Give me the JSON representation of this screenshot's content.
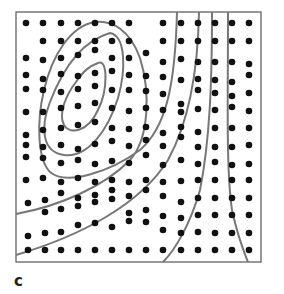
{
  "figure": {
    "panel_label": "c",
    "frame": {
      "x": 16,
      "y": 12,
      "width": 245,
      "height": 250,
      "stroke": "#555555"
    },
    "dot_color": "#111111",
    "contour_color": "#777777",
    "dots": [
      [
        26,
        23
      ],
      [
        43,
        23
      ],
      [
        61,
        23
      ],
      [
        78,
        23
      ],
      [
        95,
        23
      ],
      [
        112,
        23
      ],
      [
        129,
        23
      ],
      [
        163,
        23
      ],
      [
        181,
        23
      ],
      [
        198,
        23
      ],
      [
        215,
        23
      ],
      [
        232,
        23
      ],
      [
        249,
        23
      ],
      [
        43,
        41
      ],
      [
        61,
        41
      ],
      [
        78,
        41
      ],
      [
        95,
        41
      ],
      [
        112,
        41
      ],
      [
        129,
        41
      ],
      [
        163,
        41
      ],
      [
        181,
        41
      ],
      [
        198,
        41
      ],
      [
        215,
        41
      ],
      [
        232,
        41
      ],
      [
        249,
        41
      ],
      [
        26,
        58
      ],
      [
        43,
        60
      ],
      [
        61,
        58
      ],
      [
        78,
        55
      ],
      [
        95,
        50
      ],
      [
        112,
        58
      ],
      [
        129,
        58
      ],
      [
        146,
        53
      ],
      [
        163,
        62
      ],
      [
        181,
        59
      ],
      [
        198,
        62
      ],
      [
        215,
        62
      ],
      [
        232,
        62
      ],
      [
        249,
        64
      ],
      [
        26,
        75
      ],
      [
        43,
        79
      ],
      [
        61,
        74
      ],
      [
        78,
        76
      ],
      [
        95,
        73
      ],
      [
        112,
        71
      ],
      [
        129,
        75
      ],
      [
        146,
        76
      ],
      [
        163,
        77
      ],
      [
        181,
        80
      ],
      [
        198,
        79
      ],
      [
        215,
        80
      ],
      [
        232,
        82
      ],
      [
        249,
        75
      ],
      [
        26,
        89
      ],
      [
        43,
        90
      ],
      [
        61,
        92
      ],
      [
        78,
        89
      ],
      [
        95,
        86
      ],
      [
        112,
        90
      ],
      [
        129,
        90
      ],
      [
        146,
        91
      ],
      [
        163,
        94
      ],
      [
        181,
        104
      ],
      [
        198,
        90
      ],
      [
        215,
        93
      ],
      [
        232,
        96
      ],
      [
        249,
        93
      ],
      [
        26,
        112
      ],
      [
        43,
        112
      ],
      [
        61,
        108
      ],
      [
        78,
        106
      ],
      [
        95,
        103
      ],
      [
        112,
        108
      ],
      [
        129,
        111
      ],
      [
        146,
        108
      ],
      [
        163,
        110
      ],
      [
        181,
        112
      ],
      [
        198,
        109
      ],
      [
        215,
        110
      ],
      [
        232,
        107
      ],
      [
        249,
        111
      ],
      [
        26,
        135
      ],
      [
        43,
        130
      ],
      [
        61,
        128
      ],
      [
        78,
        125
      ],
      [
        95,
        122
      ],
      [
        112,
        128
      ],
      [
        129,
        129
      ],
      [
        146,
        127
      ],
      [
        163,
        133
      ],
      [
        181,
        127
      ],
      [
        198,
        132
      ],
      [
        215,
        128
      ],
      [
        232,
        128
      ],
      [
        249,
        128
      ],
      [
        26,
        145
      ],
      [
        43,
        147
      ],
      [
        61,
        145
      ],
      [
        78,
        149
      ],
      [
        95,
        144
      ],
      [
        112,
        141
      ],
      [
        129,
        146
      ],
      [
        146,
        140
      ],
      [
        163,
        146
      ],
      [
        181,
        137
      ],
      [
        198,
        147
      ],
      [
        215,
        147
      ],
      [
        232,
        147
      ],
      [
        249,
        145
      ],
      [
        26,
        157
      ],
      [
        43,
        158
      ],
      [
        61,
        163
      ],
      [
        78,
        160
      ],
      [
        95,
        164
      ],
      [
        112,
        161
      ],
      [
        129,
        163
      ],
      [
        146,
        155
      ],
      [
        163,
        165
      ],
      [
        181,
        160
      ],
      [
        198,
        164
      ],
      [
        215,
        162
      ],
      [
        232,
        165
      ],
      [
        249,
        164
      ],
      [
        26,
        180
      ],
      [
        43,
        178
      ],
      [
        61,
        182
      ],
      [
        78,
        178
      ],
      [
        95,
        182
      ],
      [
        112,
        180
      ],
      [
        129,
        182
      ],
      [
        146,
        180
      ],
      [
        163,
        182
      ],
      [
        181,
        181
      ],
      [
        198,
        180
      ],
      [
        215,
        180
      ],
      [
        232,
        180
      ],
      [
        249,
        180
      ],
      [
        28,
        203
      ],
      [
        45,
        200
      ],
      [
        61,
        193
      ],
      [
        78,
        198
      ],
      [
        95,
        195
      ],
      [
        112,
        190
      ],
      [
        129,
        196
      ],
      [
        146,
        190
      ],
      [
        163,
        196
      ],
      [
        181,
        202
      ],
      [
        198,
        198
      ],
      [
        215,
        198
      ],
      [
        232,
        198
      ],
      [
        249,
        198
      ],
      [
        45,
        212
      ],
      [
        61,
        209
      ],
      [
        78,
        206
      ],
      [
        95,
        202
      ],
      [
        112,
        199
      ],
      [
        129,
        213
      ],
      [
        146,
        210
      ],
      [
        163,
        216
      ],
      [
        181,
        218
      ],
      [
        198,
        215
      ],
      [
        215,
        215
      ],
      [
        232,
        215
      ],
      [
        249,
        215
      ],
      [
        28,
        236
      ],
      [
        45,
        233
      ],
      [
        61,
        232
      ],
      [
        78,
        225
      ],
      [
        95,
        223
      ],
      [
        112,
        227
      ],
      [
        129,
        221
      ],
      [
        146,
        222
      ],
      [
        163,
        230
      ],
      [
        181,
        233
      ],
      [
        198,
        232
      ],
      [
        215,
        233
      ],
      [
        232,
        233
      ],
      [
        249,
        233
      ],
      [
        28,
        250
      ],
      [
        45,
        250
      ],
      [
        61,
        250
      ],
      [
        78,
        250
      ],
      [
        95,
        250
      ],
      [
        112,
        250
      ],
      [
        129,
        250
      ],
      [
        146,
        250
      ],
      [
        163,
        250
      ],
      [
        181,
        250
      ],
      [
        198,
        250
      ],
      [
        215,
        250
      ],
      [
        232,
        250
      ],
      [
        249,
        250
      ]
    ],
    "contours": [
      {
        "name": "inner-ellipse",
        "d": "M98,63 C108,58 108,90 98,110 C88,132 70,135 64,125 C58,114 66,95 76,82 C84,70 90,66 98,63 Z"
      },
      {
        "name": "middle-ellipse",
        "d": "M110,33 C126,36 126,70 118,98 C108,130 88,158 64,155 C42,152 40,128 50,102 C60,76 78,42 110,33 Z"
      },
      {
        "name": "outer-loop",
        "d": "M16,214 C60,206 105,186 130,160 C150,138 150,90 140,58 C130,30 112,20 95,22 C70,26 52,56 44,90 C36,124 38,160 50,172 C66,186 110,172 140,150 C165,128 175,90 177,12"
      },
      {
        "name": "lower-curve",
        "d": "M16,255 C80,236 140,205 168,160 C190,120 198,70 199,12"
      },
      {
        "name": "vertical-curve-1",
        "d": "M212,12 C212,80 210,140 200,190 C190,225 175,250 163,262"
      },
      {
        "name": "vertical-curve-2",
        "d": "M228,12 C228,100 226,170 232,210 C238,238 244,252 248,262"
      }
    ]
  }
}
